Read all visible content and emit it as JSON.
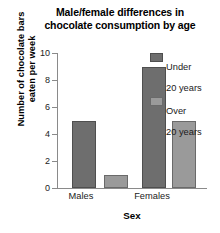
{
  "chart_data": {
    "type": "bar",
    "title": "Male/female differences in chocolate consumption by age",
    "title_line1": "Male/female differences in",
    "title_line2": "chocolate consumption by age",
    "xlabel": "Sex",
    "ylabel": "Number of chocolate bars eaten per week",
    "ylabel_line1": "Number of chocolate bars",
    "ylabel_line2": "eaten per week",
    "categories": [
      "Males",
      "Females"
    ],
    "ylim": [
      0,
      10
    ],
    "yticks": [
      10,
      8,
      6,
      4,
      2,
      0
    ],
    "grid": false,
    "legend_position": "right-top",
    "series": [
      {
        "name": "Under 20 years",
        "name_line1": "Under",
        "name_line2": "20 years",
        "color": "#6e6e6e",
        "values": [
          5,
          9
        ]
      },
      {
        "name": "Over 20 years",
        "name_line1": "Over",
        "name_line2": "20 years",
        "color": "#9a9a9a",
        "values": [
          1,
          5
        ]
      }
    ]
  },
  "colors": {
    "background": "#ffffff",
    "axis": "#8a8a8a",
    "text": "#1a1a1a",
    "series_under20": "#6e6e6e",
    "series_over20": "#9a9a9a"
  }
}
